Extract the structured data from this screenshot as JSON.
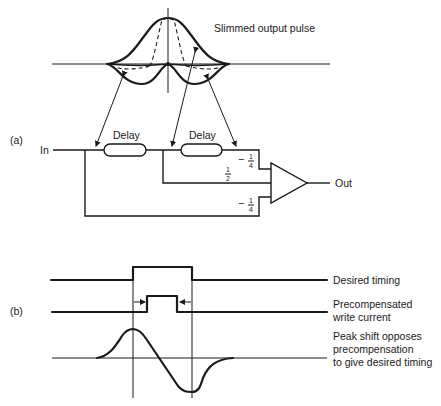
{
  "figure": {
    "part_a": {
      "label": "(a)",
      "pulse_caption": "Slimmed output pulse",
      "input_label": "In",
      "output_label": "Out",
      "delays": [
        {
          "label": "Delay"
        },
        {
          "label": "Delay"
        }
      ],
      "weights": {
        "top": {
          "sign": "−",
          "num": "1",
          "den": "4"
        },
        "middle": {
          "sign": "",
          "num": "1",
          "den": "2"
        },
        "bottom": {
          "sign": "−",
          "num": "1",
          "den": "4"
        }
      }
    },
    "part_b": {
      "label": "(b)",
      "traces": [
        {
          "label_lines": [
            "Desired timing"
          ]
        },
        {
          "label_lines": [
            "Precompensated",
            "write current"
          ]
        },
        {
          "label_lines": [
            "Peak shift opposes",
            "precompensation",
            "to give desired timing"
          ]
        }
      ]
    }
  }
}
